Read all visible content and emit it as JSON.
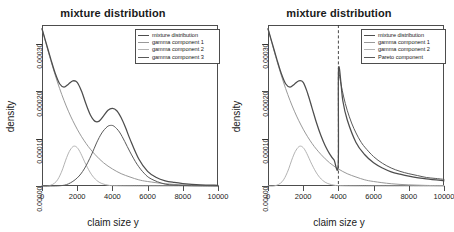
{
  "figure": {
    "width": 452,
    "height": 232,
    "background": "#ffffff"
  },
  "panels": [
    {
      "id": "left",
      "title": "mixture distribution",
      "xlabel": "claim size y",
      "ylabel": "density",
      "legend": {
        "position": "top-right",
        "entries": [
          {
            "label": "mixture distribution",
            "color": "#4d4d4d"
          },
          {
            "label": "gamma component 1",
            "color": "#999999"
          },
          {
            "label": "gamma component 2",
            "color": "#b3b3b3"
          },
          {
            "label": "gamma component 3",
            "color": "#595959"
          }
        ]
      }
    },
    {
      "id": "right",
      "title": "mixture distribution",
      "xlabel": "claim size y",
      "ylabel": "density",
      "legend": {
        "position": "top-right",
        "entries": [
          {
            "label": "mixture distribution",
            "color": "#4d4d4d"
          },
          {
            "label": "gamma component 1",
            "color": "#999999"
          },
          {
            "label": "gamma component 2",
            "color": "#b3b3b3"
          },
          {
            "label": "Pareto component",
            "color": "#595959"
          }
        ]
      }
    }
  ],
  "chart_data": [
    {
      "type": "line",
      "panel": "left",
      "title": "mixture distribution",
      "xlabel": "claim size y",
      "ylabel": "density",
      "xlim": [
        0,
        10000
      ],
      "ylim": [
        0.0,
        0.00034
      ],
      "xticks": [
        0,
        2000,
        4000,
        6000,
        8000,
        10000
      ],
      "xticklabels": [
        "0",
        "2000",
        "4000",
        "6000",
        "8000",
        "10000"
      ],
      "yticks": [
        0.0,
        0.0001,
        0.0002,
        0.0003
      ],
      "yticklabels": [
        "0.00000",
        "0.00010",
        "0.00020",
        "0.00030"
      ],
      "grid": false,
      "legend_position": "upper right",
      "series": [
        {
          "name": "mixture distribution",
          "color": "#4d4d4d",
          "x": [
            0,
            250,
            500,
            750,
            1000,
            1250,
            1500,
            1750,
            2000,
            2250,
            2500,
            2750,
            3000,
            3250,
            3500,
            3750,
            4000,
            4250,
            4500,
            4750,
            5000,
            5500,
            6000,
            6500,
            7000,
            7500,
            8000,
            9000,
            10000
          ],
          "y": [
            0.000332,
            0.0003,
            0.000268,
            0.000238,
            0.000216,
            0.000209,
            0.000215,
            0.000222,
            0.000219,
            0.0002,
            0.000173,
            0.00015,
            0.000137,
            0.000137,
            0.000148,
            0.00016,
            0.000164,
            0.000159,
            0.000144,
            0.000123,
            9.9e-05,
            5.7e-05,
            3.1e-05,
            1.8e-05,
            1.1e-05,
            7.5e-06,
            5.2e-06,
            2.6e-06,
            1.4e-06
          ]
        },
        {
          "name": "gamma component 1",
          "color": "#999999",
          "x": [
            0,
            500,
            1000,
            1500,
            2000,
            2500,
            3000,
            3500,
            4000,
            4500,
            5000,
            5500,
            6000,
            7000,
            8000,
            9000,
            10000
          ],
          "y": [
            0.000332,
            0.000265,
            0.000206,
            0.000158,
            0.00012,
            9e-05,
            6.7e-05,
            4.9e-05,
            3.6e-05,
            2.6e-05,
            1.9e-05,
            1.3e-05,
            9.5e-06,
            4.8e-06,
            2.4e-06,
            1.2e-06,
            6e-07
          ]
        },
        {
          "name": "gamma component 2",
          "color": "#b3b3b3",
          "x": [
            0,
            400,
            800,
            1100,
            1400,
            1600,
            1800,
            2000,
            2200,
            2500,
            2800,
            3100,
            3400,
            3800,
            4200,
            5000,
            6000,
            8000,
            10000
          ],
          "y": [
            0.0,
            4e-07,
            9e-06,
            2.9e-05,
            6e-05,
            7.6e-05,
            8.4e-05,
            8.1e-05,
            6.9e-05,
            4.5e-05,
            2.5e-05,
            1.2e-05,
            5.2e-06,
            1.4e-06,
            4e-07,
            4e-08,
            0.0,
            0.0,
            0.0
          ]
        },
        {
          "name": "gamma component 3",
          "color": "#595959",
          "x": [
            0,
            1000,
            1500,
            2000,
            2400,
            2800,
            3100,
            3400,
            3700,
            3900,
            4100,
            4400,
            4700,
            5000,
            5400,
            5800,
            6200,
            7000,
            8000,
            9000,
            10000
          ],
          "y": [
            0.0,
            5e-07,
            4.5e-06,
            1.7e-05,
            3.6e-05,
            6.5e-05,
            9.1e-05,
            0.000112,
            0.000125,
            0.000128,
            0.000126,
            0.000114,
            9.4e-05,
            7.2e-05,
            4.6e-05,
            2.7e-05,
            1.5e-05,
            4e-06,
            1e-06,
            3e-07,
            1e-07
          ]
        }
      ]
    },
    {
      "type": "line",
      "panel": "right",
      "title": "mixture distribution",
      "xlabel": "claim size y",
      "ylabel": "density",
      "xlim": [
        0,
        10000
      ],
      "ylim": [
        0.0,
        0.00034
      ],
      "xticks": [
        0,
        2000,
        4000,
        6000,
        8000,
        10000
      ],
      "xticklabels": [
        "0",
        "2000",
        "4000",
        "6000",
        "8000",
        "10000"
      ],
      "yticks": [
        0.0,
        0.0001,
        0.0002,
        0.0003
      ],
      "yticklabels": [
        "0.00000",
        "0.00010",
        "0.00020",
        "0.00030"
      ],
      "grid": false,
      "legend_position": "upper right",
      "threshold": 4000,
      "threshold_style": "dashed",
      "series": [
        {
          "name": "mixture distribution",
          "color": "#4d4d4d",
          "x": [
            0,
            250,
            500,
            750,
            1000,
            1250,
            1500,
            1750,
            2000,
            2250,
            2500,
            2750,
            3000,
            3250,
            3500,
            3750,
            3990,
            4010,
            4250,
            4500,
            5000,
            5500,
            6000,
            6500,
            7000,
            7500,
            8000,
            9000,
            10000
          ],
          "y": [
            0.000332,
            0.0003,
            0.000268,
            0.000238,
            0.000216,
            0.000209,
            0.000215,
            0.000222,
            0.000219,
            0.000196,
            0.000165,
            0.000134,
            0.000107,
            8.5e-05,
            6.8e-05,
            5.5e-05,
            4.6e-05,
            0.000248,
            0.00018,
            0.00014,
            9.2e-05,
            6.6e-05,
            4.9e-05,
            3.8e-05,
            3e-05,
            2.5e-05,
            2.1e-05,
            1.5e-05,
            1.1e-05
          ]
        },
        {
          "name": "gamma component 1",
          "color": "#999999",
          "x": [
            0,
            500,
            1000,
            1500,
            2000,
            2500,
            3000,
            3500,
            4000,
            4500,
            5000,
            5500,
            6000,
            7000,
            8000,
            9000,
            10000
          ],
          "y": [
            0.000332,
            0.000265,
            0.000206,
            0.000158,
            0.00012,
            9e-05,
            6.7e-05,
            4.9e-05,
            3.6e-05,
            2.6e-05,
            1.9e-05,
            1.3e-05,
            9.5e-06,
            4.8e-06,
            2.4e-06,
            1.2e-06,
            6e-07
          ]
        },
        {
          "name": "gamma component 2",
          "color": "#b3b3b3",
          "x": [
            0,
            400,
            800,
            1100,
            1400,
            1600,
            1800,
            2000,
            2200,
            2500,
            2800,
            3100,
            3400,
            3800,
            4200,
            5000,
            6000,
            8000,
            10000
          ],
          "y": [
            0.0,
            4e-07,
            9e-06,
            2.9e-05,
            6e-05,
            7.6e-05,
            8.4e-05,
            8.1e-05,
            6.9e-05,
            4.5e-05,
            2.5e-05,
            1.2e-05,
            5.2e-06,
            1.4e-06,
            4e-07,
            4e-08,
            0.0,
            0.0,
            0.0
          ]
        },
        {
          "name": "Pareto component",
          "color": "#595959",
          "x": [
            4000,
            4050,
            4150,
            4300,
            4500,
            4750,
            5000,
            5250,
            5500,
            6000,
            6500,
            7000,
            7500,
            8000,
            8500,
            9000,
            9500,
            10000
          ],
          "y": [
            0.000248,
            0.000236,
            0.000215,
            0.000188,
            0.00016,
            0.000133,
            0.000112,
            9.5e-05,
            8.2e-05,
            6.2e-05,
            4.8e-05,
            3.8e-05,
            3.1e-05,
            2.6e-05,
            2.2e-05,
            1.8e-05,
            1.6e-05,
            1.4e-05
          ]
        }
      ]
    }
  ]
}
